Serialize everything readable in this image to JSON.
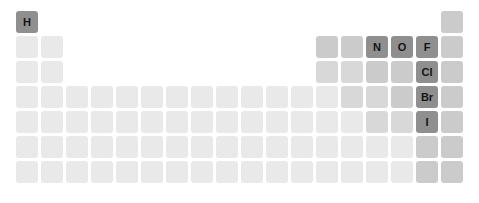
{
  "colors": {
    "highlight": "#8f8f8f",
    "medium": "#cbcbcb",
    "medium_light": "#d8d8d8",
    "light": "#e9e9e9",
    "label": "#151515"
  },
  "layout": {
    "origin_x": 16,
    "origin_y": 11,
    "pitch": 25,
    "size": 22
  },
  "highlighted": [
    "H",
    "N",
    "O",
    "F",
    "Cl",
    "Br",
    "I"
  ],
  "cells": [
    {
      "row": 1,
      "col": 1,
      "symbol": "H",
      "shade": "highlight"
    },
    {
      "row": 1,
      "col": 18,
      "symbol": "",
      "shade": "medium"
    },
    {
      "row": 2,
      "col": 1,
      "symbol": "",
      "shade": "light"
    },
    {
      "row": 2,
      "col": 2,
      "symbol": "",
      "shade": "light"
    },
    {
      "row": 2,
      "col": 13,
      "symbol": "",
      "shade": "medium"
    },
    {
      "row": 2,
      "col": 14,
      "symbol": "",
      "shade": "medium"
    },
    {
      "row": 2,
      "col": 15,
      "symbol": "N",
      "shade": "highlight"
    },
    {
      "row": 2,
      "col": 16,
      "symbol": "O",
      "shade": "highlight"
    },
    {
      "row": 2,
      "col": 17,
      "symbol": "F",
      "shade": "highlight"
    },
    {
      "row": 2,
      "col": 18,
      "symbol": "",
      "shade": "medium"
    },
    {
      "row": 3,
      "col": 1,
      "symbol": "",
      "shade": "light"
    },
    {
      "row": 3,
      "col": 2,
      "symbol": "",
      "shade": "light"
    },
    {
      "row": 3,
      "col": 13,
      "symbol": "",
      "shade": "medium_light"
    },
    {
      "row": 3,
      "col": 14,
      "symbol": "",
      "shade": "medium_light"
    },
    {
      "row": 3,
      "col": 15,
      "symbol": "",
      "shade": "medium"
    },
    {
      "row": 3,
      "col": 16,
      "symbol": "",
      "shade": "medium"
    },
    {
      "row": 3,
      "col": 17,
      "symbol": "Cl",
      "shade": "highlight"
    },
    {
      "row": 3,
      "col": 18,
      "symbol": "",
      "shade": "medium"
    },
    {
      "row": 4,
      "col": 1,
      "symbol": "",
      "shade": "light"
    },
    {
      "row": 4,
      "col": 2,
      "symbol": "",
      "shade": "light"
    },
    {
      "row": 4,
      "col": 3,
      "symbol": "",
      "shade": "light"
    },
    {
      "row": 4,
      "col": 4,
      "symbol": "",
      "shade": "light"
    },
    {
      "row": 4,
      "col": 5,
      "symbol": "",
      "shade": "light"
    },
    {
      "row": 4,
      "col": 6,
      "symbol": "",
      "shade": "light"
    },
    {
      "row": 4,
      "col": 7,
      "symbol": "",
      "shade": "light"
    },
    {
      "row": 4,
      "col": 8,
      "symbol": "",
      "shade": "light"
    },
    {
      "row": 4,
      "col": 9,
      "symbol": "",
      "shade": "light"
    },
    {
      "row": 4,
      "col": 10,
      "symbol": "",
      "shade": "light"
    },
    {
      "row": 4,
      "col": 11,
      "symbol": "",
      "shade": "light"
    },
    {
      "row": 4,
      "col": 12,
      "symbol": "",
      "shade": "light"
    },
    {
      "row": 4,
      "col": 13,
      "symbol": "",
      "shade": "light"
    },
    {
      "row": 4,
      "col": 14,
      "symbol": "",
      "shade": "medium_light"
    },
    {
      "row": 4,
      "col": 15,
      "symbol": "",
      "shade": "medium_light"
    },
    {
      "row": 4,
      "col": 16,
      "symbol": "",
      "shade": "medium"
    },
    {
      "row": 4,
      "col": 17,
      "symbol": "Br",
      "shade": "highlight"
    },
    {
      "row": 4,
      "col": 18,
      "symbol": "",
      "shade": "medium"
    },
    {
      "row": 5,
      "col": 1,
      "symbol": "",
      "shade": "light"
    },
    {
      "row": 5,
      "col": 2,
      "symbol": "",
      "shade": "light"
    },
    {
      "row": 5,
      "col": 3,
      "symbol": "",
      "shade": "light"
    },
    {
      "row": 5,
      "col": 4,
      "symbol": "",
      "shade": "light"
    },
    {
      "row": 5,
      "col": 5,
      "symbol": "",
      "shade": "light"
    },
    {
      "row": 5,
      "col": 6,
      "symbol": "",
      "shade": "light"
    },
    {
      "row": 5,
      "col": 7,
      "symbol": "",
      "shade": "light"
    },
    {
      "row": 5,
      "col": 8,
      "symbol": "",
      "shade": "light"
    },
    {
      "row": 5,
      "col": 9,
      "symbol": "",
      "shade": "light"
    },
    {
      "row": 5,
      "col": 10,
      "symbol": "",
      "shade": "light"
    },
    {
      "row": 5,
      "col": 11,
      "symbol": "",
      "shade": "light"
    },
    {
      "row": 5,
      "col": 12,
      "symbol": "",
      "shade": "light"
    },
    {
      "row": 5,
      "col": 13,
      "symbol": "",
      "shade": "light"
    },
    {
      "row": 5,
      "col": 14,
      "symbol": "",
      "shade": "light"
    },
    {
      "row": 5,
      "col": 15,
      "symbol": "",
      "shade": "medium_light"
    },
    {
      "row": 5,
      "col": 16,
      "symbol": "",
      "shade": "medium_light"
    },
    {
      "row": 5,
      "col": 17,
      "symbol": "I",
      "shade": "highlight"
    },
    {
      "row": 5,
      "col": 18,
      "symbol": "",
      "shade": "medium"
    },
    {
      "row": 6,
      "col": 1,
      "symbol": "",
      "shade": "light"
    },
    {
      "row": 6,
      "col": 2,
      "symbol": "",
      "shade": "light"
    },
    {
      "row": 6,
      "col": 3,
      "symbol": "",
      "shade": "light"
    },
    {
      "row": 6,
      "col": 4,
      "symbol": "",
      "shade": "light"
    },
    {
      "row": 6,
      "col": 5,
      "symbol": "",
      "shade": "light"
    },
    {
      "row": 6,
      "col": 6,
      "symbol": "",
      "shade": "light"
    },
    {
      "row": 6,
      "col": 7,
      "symbol": "",
      "shade": "light"
    },
    {
      "row": 6,
      "col": 8,
      "symbol": "",
      "shade": "light"
    },
    {
      "row": 6,
      "col": 9,
      "symbol": "",
      "shade": "light"
    },
    {
      "row": 6,
      "col": 10,
      "symbol": "",
      "shade": "light"
    },
    {
      "row": 6,
      "col": 11,
      "symbol": "",
      "shade": "light"
    },
    {
      "row": 6,
      "col": 12,
      "symbol": "",
      "shade": "light"
    },
    {
      "row": 6,
      "col": 13,
      "symbol": "",
      "shade": "light"
    },
    {
      "row": 6,
      "col": 14,
      "symbol": "",
      "shade": "light"
    },
    {
      "row": 6,
      "col": 15,
      "symbol": "",
      "shade": "light"
    },
    {
      "row": 6,
      "col": 16,
      "symbol": "",
      "shade": "light"
    },
    {
      "row": 6,
      "col": 17,
      "symbol": "",
      "shade": "medium"
    },
    {
      "row": 6,
      "col": 18,
      "symbol": "",
      "shade": "medium"
    },
    {
      "row": 7,
      "col": 1,
      "symbol": "",
      "shade": "light"
    },
    {
      "row": 7,
      "col": 2,
      "symbol": "",
      "shade": "light"
    },
    {
      "row": 7,
      "col": 3,
      "symbol": "",
      "shade": "light"
    },
    {
      "row": 7,
      "col": 4,
      "symbol": "",
      "shade": "light"
    },
    {
      "row": 7,
      "col": 5,
      "symbol": "",
      "shade": "light"
    },
    {
      "row": 7,
      "col": 6,
      "symbol": "",
      "shade": "light"
    },
    {
      "row": 7,
      "col": 7,
      "symbol": "",
      "shade": "light"
    },
    {
      "row": 7,
      "col": 8,
      "symbol": "",
      "shade": "light"
    },
    {
      "row": 7,
      "col": 9,
      "symbol": "",
      "shade": "light"
    },
    {
      "row": 7,
      "col": 10,
      "symbol": "",
      "shade": "light"
    },
    {
      "row": 7,
      "col": 11,
      "symbol": "",
      "shade": "light"
    },
    {
      "row": 7,
      "col": 12,
      "symbol": "",
      "shade": "light"
    },
    {
      "row": 7,
      "col": 13,
      "symbol": "",
      "shade": "light"
    },
    {
      "row": 7,
      "col": 14,
      "symbol": "",
      "shade": "light"
    },
    {
      "row": 7,
      "col": 15,
      "symbol": "",
      "shade": "light"
    },
    {
      "row": 7,
      "col": 16,
      "symbol": "",
      "shade": "light"
    },
    {
      "row": 7,
      "col": 17,
      "symbol": "",
      "shade": "medium"
    },
    {
      "row": 7,
      "col": 18,
      "symbol": "",
      "shade": "medium"
    }
  ]
}
